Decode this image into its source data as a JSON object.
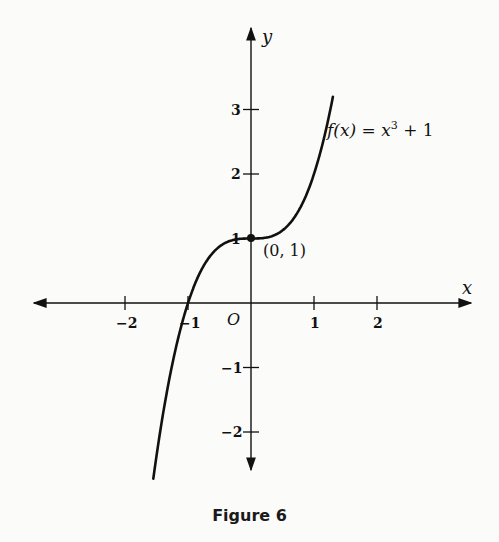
{
  "chart_data": {
    "type": "line",
    "title": "",
    "caption": "Figure 6",
    "xlabel": "x",
    "ylabel": "y",
    "x_ticks": [
      "-2",
      "-1",
      "1",
      "2"
    ],
    "y_ticks": [
      "3",
      "2",
      "1",
      "-1",
      "-2"
    ],
    "origin_label": "O",
    "xlim": [
      -3.3,
      3.5
    ],
    "ylim": [
      -2.9,
      3.8
    ],
    "grid": false,
    "series": [
      {
        "name": "f(x) = x³ + 1",
        "function": "x^3 + 1",
        "x_range": [
          -1.55,
          1.3
        ]
      }
    ],
    "annotations": [
      {
        "text": "f(x) = x³ + 1",
        "label_position": [
          1.45,
          2.7
        ]
      },
      {
        "text": "(0, 1)",
        "point": [
          0,
          1
        ],
        "marked": true
      }
    ]
  },
  "labels": {
    "func_label_f": "f(x) = x",
    "func_label_exp": "3",
    "func_label_tail": " + 1",
    "point_label": "(0, 1)",
    "caption": "Figure 6"
  }
}
